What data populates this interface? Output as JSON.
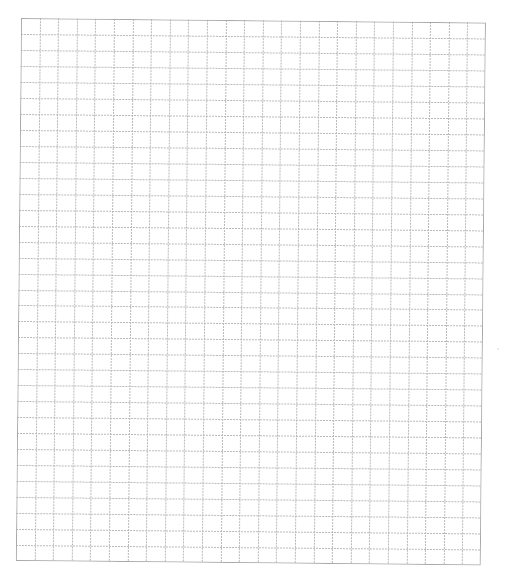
{
  "sheet": {
    "type": "graph-paper",
    "columns": 25,
    "rows": 34,
    "line_color": "#b9b9b9",
    "border_color": "#a8a8a8",
    "background": "#ffffff"
  }
}
